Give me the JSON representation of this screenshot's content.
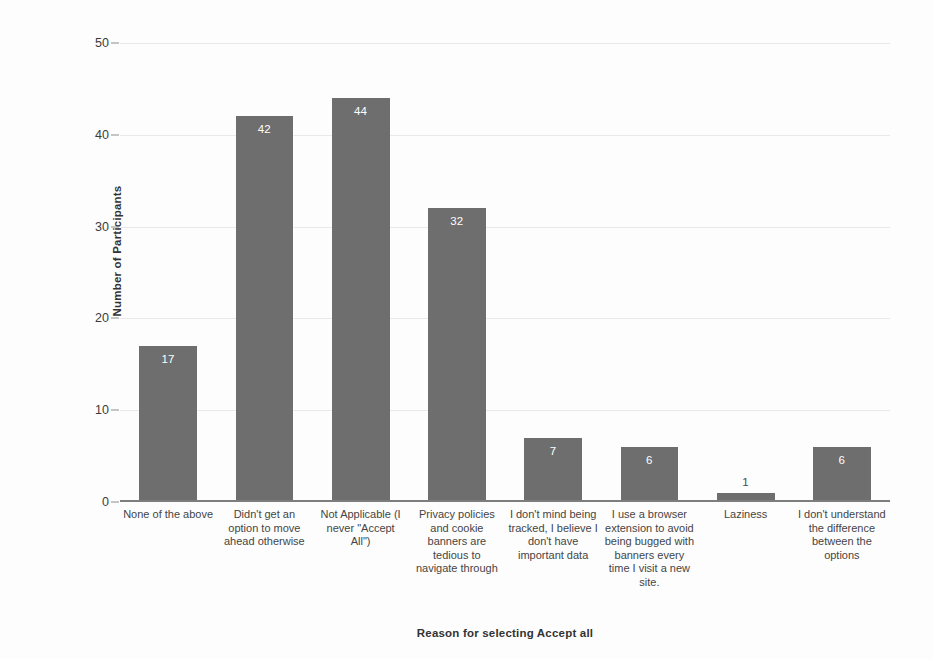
{
  "chart_data": {
    "type": "bar",
    "title": "",
    "xlabel": "Reason for selecting Accept all",
    "ylabel": "Number of Participants",
    "ylim": [
      0,
      50
    ],
    "yticks": [
      0,
      10,
      20,
      30,
      40,
      50
    ],
    "grid": true,
    "legend": false,
    "bar_color": "#6e6e6e",
    "background_color": "#fdfdfd",
    "value_labels_inside_bars": true,
    "categories": [
      "None of the above",
      "Didn't get an option to move ahead otherwise",
      "Not Applicable (I never \"Accept All\")",
      "Privacy policies and cookie banners are tedious to navigate through",
      "I don't mind being tracked, I believe I don't have important data",
      "I use a browser extension to avoid being bugged with banners every time I visit a new site.",
      "Laziness",
      "I don't understand the difference between the options"
    ],
    "values": [
      17,
      42,
      44,
      32,
      7,
      6,
      1,
      6
    ],
    "value_label_text": [
      "17",
      "42",
      "44",
      "32",
      "7",
      "6",
      "1",
      "6"
    ],
    "ytick_labels": [
      "0",
      "10",
      "20",
      "30",
      "40",
      "50"
    ]
  }
}
